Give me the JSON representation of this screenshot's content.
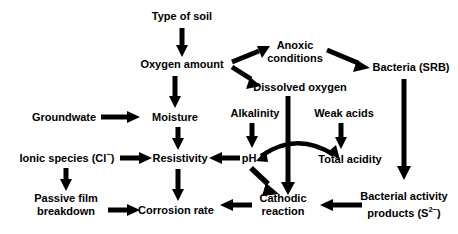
{
  "diagram": {
    "type": "flowchart",
    "background_color": "#ffffff",
    "stroke_color": "#000000",
    "canvas": {
      "width": 458,
      "height": 234
    },
    "nodes": [
      {
        "id": "type-of-soil",
        "label": "Type of soil",
        "x": 182,
        "y": 16
      },
      {
        "id": "oxygen-amount",
        "label": "Oxygen amount",
        "x": 182,
        "y": 64
      },
      {
        "id": "anoxic-conditions",
        "label_line1": "Anoxic",
        "label_line2": "conditions",
        "x": 295,
        "y": 52
      },
      {
        "id": "dissolved-oxygen",
        "label": "Dissolved oxygen",
        "x": 300,
        "y": 87
      },
      {
        "id": "bacteria-srb",
        "label": "Bacteria (SRB)",
        "x": 411,
        "y": 67
      },
      {
        "id": "groundwater",
        "label": "Groundwate",
        "x": 64,
        "y": 117
      },
      {
        "id": "moisture",
        "label": "Moisture",
        "x": 175,
        "y": 117
      },
      {
        "id": "alkalinity",
        "label": "Alkalinity",
        "x": 255,
        "y": 113
      },
      {
        "id": "weak-acids",
        "label": "Weak acids",
        "x": 344,
        "y": 113
      },
      {
        "id": "ionic-species",
        "label": "Ionic species (Cl",
        "label_sup": "−",
        "label_tail": ")",
        "x": 67,
        "y": 158
      },
      {
        "id": "resistivity",
        "label": "Resistivity",
        "x": 180,
        "y": 158
      },
      {
        "id": "ph",
        "label": "pH",
        "x": 249,
        "y": 158
      },
      {
        "id": "total-acidity",
        "label": "Total acidity",
        "x": 350,
        "y": 159
      },
      {
        "id": "passive-film-breakdown",
        "label_line1": "Passive film",
        "label_line2": "breakdown",
        "x": 66,
        "y": 205
      },
      {
        "id": "corrosion-rate",
        "label": "Corrosion rate",
        "x": 176,
        "y": 210
      },
      {
        "id": "cathodic-reaction",
        "label_line1": "Cathodic",
        "label_line2": "reaction",
        "x": 283,
        "y": 205
      },
      {
        "id": "bacterial-activity",
        "label_line1": "Bacterial activity",
        "label_line2_pre": "products (S",
        "label_line2_sup": "2−",
        "label_line2_tail": ")",
        "x": 404,
        "y": 205
      }
    ],
    "edges": [
      {
        "id": "type-of-soil-to-oxygen-amount",
        "from": "type-of-soil",
        "to": "oxygen-amount",
        "kind": "straight"
      },
      {
        "id": "oxygen-amount-to-anoxic-conditions",
        "from": "oxygen-amount",
        "to": "anoxic-conditions",
        "kind": "straight"
      },
      {
        "id": "oxygen-amount-to-dissolved-oxygen",
        "from": "oxygen-amount",
        "to": "dissolved-oxygen",
        "kind": "straight"
      },
      {
        "id": "anoxic-conditions-to-bacteria-srb",
        "from": "anoxic-conditions",
        "to": "bacteria-srb",
        "kind": "straight"
      },
      {
        "id": "oxygen-amount-to-moisture",
        "from": "oxygen-amount",
        "to": "moisture",
        "kind": "straight"
      },
      {
        "id": "groundwater-to-moisture",
        "from": "groundwater",
        "to": "moisture",
        "kind": "straight"
      },
      {
        "id": "moisture-to-resistivity",
        "from": "moisture",
        "to": "resistivity",
        "kind": "straight"
      },
      {
        "id": "ionic-species-to-resistivity",
        "from": "ionic-species",
        "to": "resistivity",
        "kind": "straight"
      },
      {
        "id": "ionic-species-to-passive-film-breakdown",
        "from": "ionic-species",
        "to": "passive-film-breakdown",
        "kind": "straight"
      },
      {
        "id": "passive-film-breakdown-to-corrosion-rate",
        "from": "passive-film-breakdown",
        "to": "corrosion-rate",
        "kind": "straight"
      },
      {
        "id": "resistivity-to-corrosion-rate",
        "from": "resistivity",
        "to": "corrosion-rate",
        "kind": "straight"
      },
      {
        "id": "ph-to-resistivity",
        "from": "ph",
        "to": "resistivity",
        "kind": "straight"
      },
      {
        "id": "alkalinity-to-ph",
        "from": "alkalinity",
        "to": "ph",
        "kind": "straight"
      },
      {
        "id": "weak-acids-to-total-acidity",
        "from": "weak-acids",
        "to": "total-acidity",
        "kind": "straight"
      },
      {
        "id": "ph-total-acidity-bidirectional",
        "from": "ph",
        "to": "total-acidity",
        "kind": "curved-double"
      },
      {
        "id": "ph-to-cathodic-reaction",
        "from": "ph",
        "to": "cathodic-reaction",
        "kind": "straight"
      },
      {
        "id": "dissolved-oxygen-to-cathodic-reaction",
        "from": "dissolved-oxygen",
        "to": "cathodic-reaction",
        "kind": "straight"
      },
      {
        "id": "cathodic-reaction-to-corrosion-rate",
        "from": "cathodic-reaction",
        "to": "corrosion-rate",
        "kind": "straight"
      },
      {
        "id": "bacteria-srb-to-bacterial-activity",
        "from": "bacteria-srb",
        "to": "bacterial-activity",
        "kind": "straight"
      },
      {
        "id": "bacterial-activity-to-cathodic-reaction",
        "from": "bacterial-activity",
        "to": "cathodic-reaction",
        "kind": "straight"
      }
    ]
  }
}
